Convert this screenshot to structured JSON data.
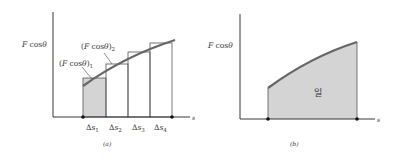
{
  "panel_a": {
    "y_label": "F cos θ",
    "x_label": "s",
    "caption": "(a)",
    "annotations": [
      "(F cos θ)₁",
      "(F cos θ)₂"
    ],
    "interval_labels": [
      "Δs₁",
      "Δs₂",
      "Δs₃",
      "Δs₄"
    ]
  },
  "panel_b": {
    "y_label": "F cos θ",
    "x_label": "s",
    "caption": "(b)",
    "area_label": "일"
  },
  "colors": {
    "axis": "#222222",
    "curve": "#666666",
    "shaded": "#d4d4d4",
    "rect_border": "#555555"
  }
}
